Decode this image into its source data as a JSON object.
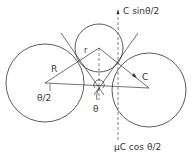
{
  "diagram": {
    "labels": {
      "force_up": "C sinθ/2",
      "force_down": "μC cos θ/2",
      "radius_large": "R",
      "radius_small": "r",
      "half_angle": "θ/2",
      "angle": "θ",
      "contact_force": "C"
    },
    "colors": {
      "stroke": "#333333",
      "background": "#ffffff"
    }
  }
}
